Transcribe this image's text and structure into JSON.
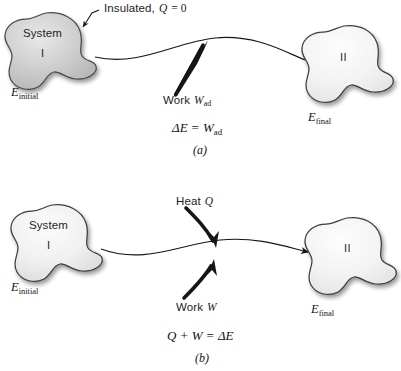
{
  "figure": {
    "title_implicit": "First law of thermodynamics: adiabatic work and heat plus work",
    "background_color": "#ffffff",
    "ink_color": "#16161a",
    "blob_fill_dark": "#c9c9c9",
    "blob_fill_light": "#f4f4f4",
    "blob_stroke": "#3a3a3a"
  },
  "panels": [
    {
      "id": "panel-a",
      "caption": "(a)",
      "callout": {
        "text_plain": "Insulated, Q = 0",
        "lead": "Insulated,",
        "symbol": "Q",
        "relation": "= 0"
      },
      "initial_state": {
        "system_label": "System",
        "roman_numeral": "I",
        "energy_symbol": "E",
        "energy_subscript": "initial"
      },
      "final_state": {
        "roman_numeral": "II",
        "energy_symbol": "E",
        "energy_subscript": "final"
      },
      "flows": [
        {
          "name": "work-adiabatic",
          "label_lead": "Work",
          "label_symbol": "W",
          "label_subscript": "ad",
          "arrow_style": "straight",
          "direction": "into-system"
        }
      ],
      "equation": {
        "text_plain": "ΔE = W_ad",
        "lhs_delta": "Δ",
        "lhs_symbol": "E",
        "operator": "=",
        "rhs_symbol": "W",
        "rhs_subscript": "ad"
      }
    },
    {
      "id": "panel-b",
      "caption": "(b)",
      "initial_state": {
        "system_label": "System",
        "roman_numeral": "I",
        "energy_symbol": "E",
        "energy_subscript": "initial"
      },
      "final_state": {
        "roman_numeral": "II",
        "energy_symbol": "E",
        "energy_subscript": "final"
      },
      "flows": [
        {
          "name": "heat",
          "label_lead": "Heat",
          "label_symbol": "Q",
          "label_subscript": "",
          "arrow_style": "curved",
          "direction": "into-system"
        },
        {
          "name": "work",
          "label_lead": "Work",
          "label_symbol": "W",
          "label_subscript": "",
          "arrow_style": "curved",
          "direction": "into-system"
        }
      ],
      "equation": {
        "text_plain": "Q + W = ΔE",
        "term1": "Q",
        "plus": "+",
        "term2": "W",
        "operator": "=",
        "rhs_delta": "Δ",
        "rhs_symbol": "E"
      }
    }
  ]
}
